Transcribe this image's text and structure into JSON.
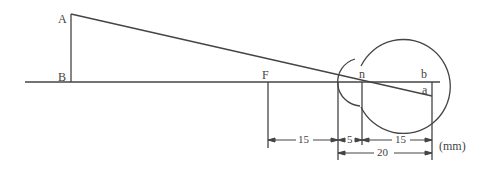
{
  "diagram": {
    "points": {
      "A": "A",
      "B": "B",
      "F": "F",
      "n": "n",
      "b": "b",
      "a": "a"
    },
    "dimensions": {
      "focal_to_cornea": "15",
      "cornea_to_nodal": "5",
      "nodal_to_retina": "15",
      "cornea_to_retina": "20",
      "unit": "(mm)"
    },
    "colors": {
      "line": "#444444",
      "background": "#ffffff"
    }
  }
}
